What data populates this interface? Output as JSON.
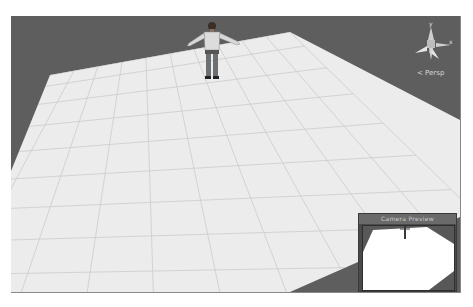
{
  "scene_view": {
    "background_color": "#5e5e5e",
    "ground_color": "#ececec",
    "grid_color": "#c8c8c8",
    "character": "humanoid-t-pose"
  },
  "gizmo": {
    "y_label": "y",
    "x_label": "x",
    "projection_label": "< Persp"
  },
  "camera_preview": {
    "title": "Camera Preview"
  }
}
